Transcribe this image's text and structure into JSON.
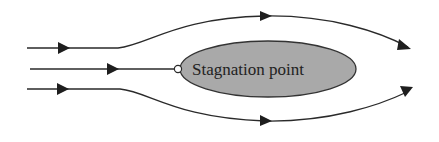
{
  "diagram": {
    "body": {
      "label": "Stagnation point",
      "fill": "#a9a9a9",
      "stroke": "#333333"
    },
    "streamlines": [
      {
        "name": "upper",
        "direction": "left-to-right"
      },
      {
        "name": "center",
        "direction": "left-to-right",
        "ends_at": "stagnation point"
      },
      {
        "name": "lower",
        "direction": "left-to-right"
      }
    ],
    "colors": {
      "line": "#2a2a2a",
      "arrow": "#1e1e1e",
      "stagnation_marker_fill": "#ffffff"
    }
  }
}
